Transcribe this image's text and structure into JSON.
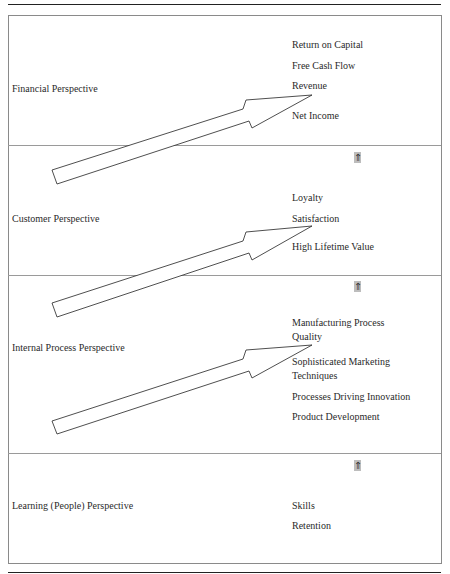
{
  "diagram": {
    "type": "balanced-scorecard-strategy-map",
    "perspectives": [
      {
        "name": "Financial Perspective",
        "metrics": [
          "Return on Capital",
          "Free Cash Flow",
          "Revenue",
          "Net Income"
        ],
        "has_up_icon": false
      },
      {
        "name": "Customer Perspective",
        "metrics": [
          "Loyalty",
          "Satisfaction",
          "High Lifetime Value"
        ],
        "has_up_icon": true
      },
      {
        "name": "Internal Process Perspective",
        "metrics": [
          "Manufacturing Process Quality",
          "Sophisticated Marketing Techniques",
          "Processes Driving Innovation",
          "Product Development"
        ],
        "metrics_display_lines": {
          "m0_line1": "Manufacturing Process",
          "m0_line2": "Quality",
          "m1_line1": "Sophisticated Marketing",
          "m1_line2": "Techniques"
        },
        "has_up_icon": true
      },
      {
        "name": "Learning (People) Perspective",
        "metrics": [
          "Skills",
          "Retention"
        ],
        "has_up_icon": true
      }
    ],
    "icons": {
      "up_icon": "⇑",
      "up_icon_name": "double-up-arrow-icon"
    },
    "colors": {
      "rule": "#222222",
      "border": "#8a8a8a",
      "text": "#2a2a2a",
      "icon_bg": "#bdbdbd",
      "arrow_stroke": "#222222"
    }
  }
}
